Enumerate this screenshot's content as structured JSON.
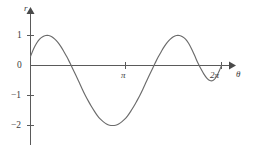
{
  "figure": {
    "background_color": "#ffffff",
    "curve_color": "#6b6b6b",
    "axis_color": "#5a5a5a"
  },
  "axes": {
    "y_axis_label": "r",
    "x_axis_label": "θ"
  },
  "chart_data": {
    "type": "line",
    "title": "",
    "subtitle": "",
    "xlabel": "θ",
    "ylabel": "r",
    "grid": false,
    "legend": null,
    "xlim": [
      0,
      6.8
    ],
    "ylim": [
      -2.6,
      1.5
    ],
    "x_tick_labels": [
      "π",
      "2π"
    ],
    "x_tick_values": [
      3.141592653589793,
      6.283185307179586
    ],
    "y_tick_labels": [
      "1",
      "0",
      "−1",
      "−2"
    ],
    "y_tick_values": [
      1,
      0,
      -1,
      -2
    ],
    "series": [
      {
        "name": "r(θ)",
        "x": [
          0.0,
          0.1,
          0.2,
          0.3,
          0.4,
          0.5,
          0.6,
          0.7,
          0.8,
          0.9,
          1.0,
          1.1,
          1.2,
          1.3,
          1.4,
          1.5,
          1.6,
          1.7,
          1.8,
          1.9,
          2.0,
          2.1,
          2.2,
          2.3,
          2.4,
          2.5,
          2.6,
          2.7,
          2.8,
          2.9,
          3.0,
          3.1,
          3.2,
          3.3,
          3.4,
          3.5,
          3.6,
          3.7,
          3.8,
          3.9,
          4.0,
          4.1,
          4.2,
          4.3,
          4.4,
          4.5,
          4.6,
          4.7,
          4.8,
          4.9,
          5.0,
          5.1,
          5.2,
          5.3,
          5.4,
          5.5,
          5.6,
          5.7,
          5.8,
          5.9,
          6.0,
          6.1,
          6.2,
          6.283185307179586
        ],
        "y": [
          0.3,
          0.55,
          0.74,
          0.88,
          0.96,
          1.0,
          1.0,
          0.96,
          0.88,
          0.77,
          0.63,
          0.46,
          0.28,
          0.08,
          -0.13,
          -0.34,
          -0.56,
          -0.78,
          -0.99,
          -1.18,
          -1.36,
          -1.52,
          -1.67,
          -1.79,
          -1.88,
          -1.95,
          -1.99,
          -2.0,
          -1.99,
          -1.95,
          -1.88,
          -1.79,
          -1.67,
          -1.52,
          -1.36,
          -1.18,
          -0.99,
          -0.78,
          -0.56,
          -0.34,
          -0.13,
          0.08,
          0.28,
          0.46,
          0.63,
          0.77,
          0.88,
          0.96,
          1.0,
          1.0,
          0.96,
          0.88,
          0.74,
          0.55,
          0.33,
          0.1,
          -0.1,
          -0.28,
          -0.42,
          -0.5,
          -0.5,
          -0.4,
          -0.2,
          0.0
        ],
        "max_value": 1,
        "min_value": -2,
        "zero_crossings": [
          1.27,
          4.02,
          6.28
        ]
      }
    ],
    "annotations": []
  }
}
